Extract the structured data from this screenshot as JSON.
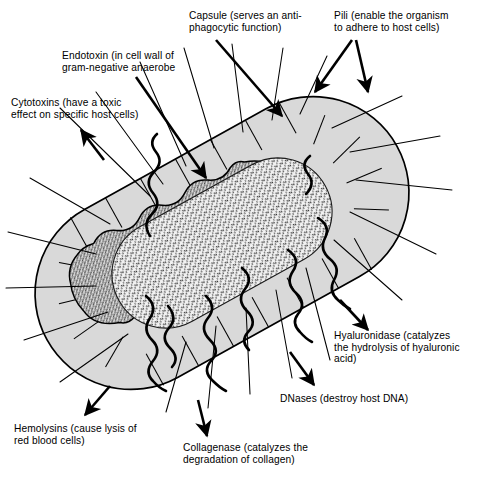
{
  "figure": {
    "background_color": "#ffffff",
    "ink_color": "#000000",
    "capsule_fill": "#d9d9d9",
    "cell_wall_fill": "#c4c4c4",
    "cytoplasm_fill": "#ededed"
  },
  "labels": {
    "capsule": "Capsule (serves an anti-\nphagocytic function)",
    "pili": "Pili (enable the organism\nto adhere to host cells)",
    "endotoxin": "Endotoxin (in cell wall of\ngram-negative anaerobe",
    "cytotoxins": "Cytotoxins (have a toxic\neffect on specific host cells)",
    "hyaluronidase": "Hyaluronidase (catalyzes\nthe hydrolysis of hyaluronic\nacid)",
    "dnases": "DNases (destroy host DNA)",
    "collagenase": "Collagenase (catalyzes the\ndegradation of collagen)",
    "hemolysins": "Hemolysins (cause lysis of\nred blood cells)"
  },
  "structures": {
    "capsule_name": "capsule",
    "cell_wall_name": "cell-wall",
    "cytoplasm_name": "cytoplasm",
    "pili_count": 22,
    "flagella_count": 7
  }
}
